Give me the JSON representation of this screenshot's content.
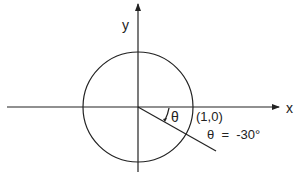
{
  "diagram": {
    "axes": {
      "x_label": "x",
      "y_label": "y"
    },
    "circle": {
      "center": [
        138,
        107
      ],
      "radius": 55
    },
    "point_label": "(1,0)",
    "angle_symbol": "θ",
    "angle_annotation": "θ  =  -30°",
    "ray": {
      "from": [
        138,
        107
      ],
      "to": [
        216,
        151
      ],
      "angle_deg": -30
    },
    "colors": {
      "stroke": "#222222",
      "background": "#ffffff"
    }
  }
}
